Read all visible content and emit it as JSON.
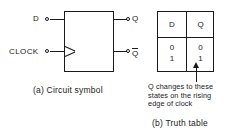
{
  "circuit": {
    "inputs": {
      "d_label": "D",
      "clock_label": "CLOCK"
    },
    "outputs": {
      "q_label": "Q",
      "qbar_label": "Q"
    },
    "clock_edge_marker": "dynamic-input-triangle",
    "caption": "(a) Circuit symbol"
  },
  "truth_table": {
    "headers": [
      "D",
      "Q"
    ],
    "rows": [
      [
        "0",
        "0"
      ],
      [
        "1",
        "1"
      ]
    ],
    "columns": {
      "d": [
        "0",
        "1"
      ],
      "q": [
        "0",
        "1"
      ]
    },
    "annotation": {
      "line1": "Q changes to these",
      "line2": "states on the rising",
      "line3": "edge of clock",
      "arrow": "up-arrow"
    },
    "caption": "(b) Truth table"
  },
  "colors": {
    "ink": "#1a1a1a",
    "paper": "#ffffff"
  }
}
